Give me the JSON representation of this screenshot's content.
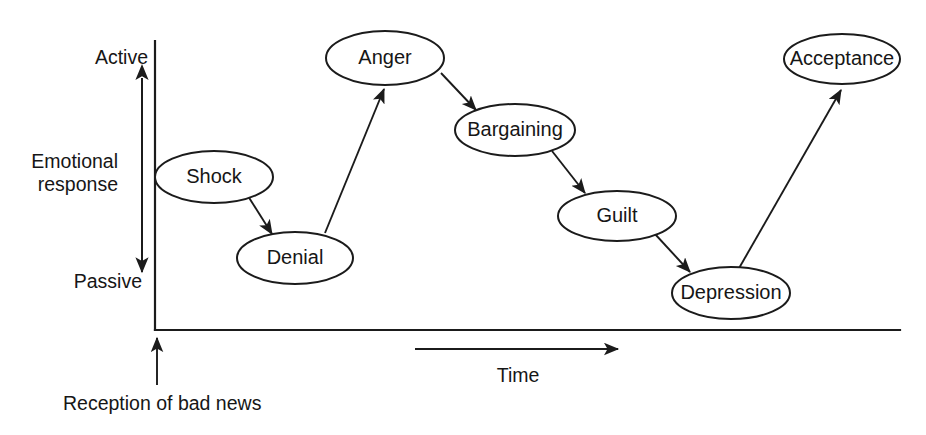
{
  "figure": {
    "kind": "process-curve-diagram",
    "background_color": "#ffffff",
    "ink_color": "#1b1b1b",
    "width": 926,
    "height": 435
  },
  "axes": {
    "y_axis": {
      "top_label": "Active",
      "mid_label_line1": "Emotional",
      "mid_label_line2": "response",
      "bottom_label": "Passive",
      "x": 155,
      "y_top": 41,
      "y_bottom": 330
    },
    "x_axis": {
      "label": "Time",
      "y": 330,
      "x_start": 155,
      "x_end": 900
    },
    "origin_annotation": {
      "label": "Reception of bad news",
      "x": 157,
      "y_from": 385,
      "y_to": 338
    },
    "time_arrow": {
      "x_from": 415,
      "x_to": 618,
      "y": 349
    },
    "response_range_arrow": {
      "x": 142,
      "y_top": 78,
      "y_bottom": 272
    }
  },
  "stages": [
    {
      "id": "shock",
      "label": "Shock",
      "cx": 214,
      "cy": 177,
      "rx": 59,
      "ry": 26
    },
    {
      "id": "denial",
      "label": "Denial",
      "cx": 295,
      "cy": 258,
      "rx": 58,
      "ry": 26
    },
    {
      "id": "anger",
      "label": "Anger",
      "cx": 385,
      "cy": 58,
      "rx": 59,
      "ry": 27
    },
    {
      "id": "bargaining",
      "label": "Bargaining",
      "cx": 515,
      "cy": 130,
      "rx": 60,
      "ry": 26
    },
    {
      "id": "guilt",
      "label": "Guilt",
      "cx": 617,
      "cy": 216,
      "rx": 59,
      "ry": 25
    },
    {
      "id": "depression",
      "label": "Depression",
      "cx": 731,
      "cy": 293,
      "rx": 59,
      "ry": 26
    },
    {
      "id": "acceptance",
      "label": "Acceptance",
      "cx": 842,
      "cy": 59,
      "rx": 58,
      "ry": 25
    }
  ],
  "transitions": [
    {
      "id": "shock-to-denial",
      "from": "Shock",
      "to": "Denial",
      "x1": 248,
      "y1": 196,
      "x2": 272,
      "y2": 234,
      "arrowhead": true
    },
    {
      "id": "denial-to-anger",
      "from": "Denial",
      "to": "Anger",
      "x1": 325,
      "y1": 233,
      "x2": 384,
      "y2": 89,
      "arrowhead": true
    },
    {
      "id": "anger-to-bargaining",
      "from": "Anger",
      "to": "Bargaining",
      "x1": 441,
      "y1": 73,
      "x2": 476,
      "y2": 110,
      "arrowhead": true
    },
    {
      "id": "bargaining-to-guilt",
      "from": "Bargaining",
      "to": "Guilt",
      "x1": 552,
      "y1": 151,
      "x2": 585,
      "y2": 193,
      "arrowhead": true
    },
    {
      "id": "guilt-to-depression",
      "from": "Guilt",
      "to": "Depression",
      "x1": 655,
      "y1": 234,
      "x2": 690,
      "y2": 272,
      "arrowhead": true
    },
    {
      "id": "depression-to-acceptance",
      "from": "Depression",
      "to": "Acceptance",
      "x1": 738,
      "y1": 270,
      "x2": 841,
      "y2": 90,
      "arrowhead": true
    }
  ],
  "chart_data": {
    "type": "line",
    "title": "",
    "xlabel": "Time",
    "ylabel": "Emotional response",
    "ytick_labels": [
      "Active",
      "Passive"
    ],
    "grid": false,
    "legend": "none",
    "annotations": [
      "Reception of bad news"
    ],
    "categories": [
      "Shock",
      "Denial",
      "Anger",
      "Bargaining",
      "Guilt",
      "Depression",
      "Acceptance"
    ],
    "series": [
      {
        "name": "Emotional response over time",
        "points": [
          {
            "label": "Shock",
            "x": 214,
            "y": 177
          },
          {
            "label": "Denial",
            "x": 295,
            "y": 258
          },
          {
            "label": "Anger",
            "x": 385,
            "y": 58
          },
          {
            "label": "Bargaining",
            "x": 515,
            "y": 130
          },
          {
            "label": "Guilt",
            "x": 617,
            "y": 216
          },
          {
            "label": "Depression",
            "x": 731,
            "y": 293
          },
          {
            "label": "Acceptance",
            "x": 842,
            "y": 59
          }
        ]
      }
    ]
  }
}
